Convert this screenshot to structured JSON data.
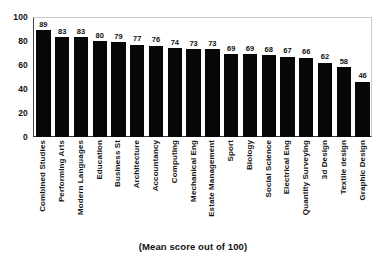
{
  "chart_data": {
    "type": "bar",
    "title": "",
    "subtitle": "",
    "caption": "(Mean score out of 100)",
    "xlabel": "",
    "ylabel": "",
    "ylim": [
      0,
      100
    ],
    "yticks": [
      0,
      20,
      40,
      60,
      80,
      100
    ],
    "grid": false,
    "legend": false,
    "orientation": "vertical",
    "bar_color": "#070707",
    "value_labels": true,
    "categories": [
      "Combined Studies",
      "Performing Arts",
      "Modern Languages",
      "Education",
      "Business St",
      "Architecture",
      "Accountancy",
      "Computing",
      "Mechanical Eng",
      "Estate Management",
      "Sport",
      "Biology",
      "Social Science",
      "Electrical Eng",
      "Quantity Surveying",
      "3d Design",
      "Textile design",
      "Graphic Design"
    ],
    "values": [
      89,
      83,
      83,
      80,
      79,
      77,
      76,
      74,
      73,
      73,
      69,
      69,
      68,
      67,
      66,
      62,
      58,
      46
    ]
  }
}
